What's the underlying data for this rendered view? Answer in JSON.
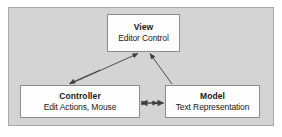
{
  "diagram": {
    "kind": "mvc-architecture-diagram",
    "panel_color": "#d4d4d4",
    "panel_border_color": "#a8a8a8",
    "node_fill": "#fdfdfd",
    "node_border_color": "#8c8c8c",
    "connector_color": "#3d3d3d",
    "text_color": "#1a1a1a",
    "nodes": [
      {
        "id": "view",
        "title": "View",
        "subtitle": "Editor Control"
      },
      {
        "id": "controller",
        "title": "Controller",
        "subtitle": "Edit Actions, Mouse"
      },
      {
        "id": "model",
        "title": "Model",
        "subtitle": "Text Representation"
      }
    ],
    "connectors": [
      {
        "id": "controller-to-view",
        "from": "controller",
        "to": "view",
        "style": "double-headed-diagonal"
      },
      {
        "id": "model-to-view",
        "from": "model",
        "to": "view",
        "style": "single-headed-diagonal"
      },
      {
        "id": "controller-model",
        "from": "controller",
        "to": "model",
        "style": "double-headed-horizontal"
      }
    ]
  }
}
